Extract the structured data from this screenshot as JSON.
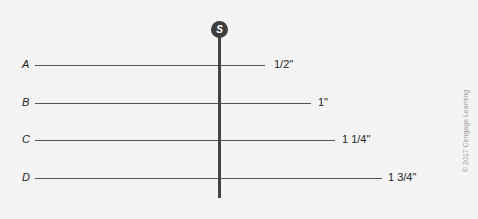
{
  "diagram": {
    "source_label": "S",
    "rows": [
      {
        "label": "A",
        "measurement": "1/2\"",
        "y": 65,
        "line_end": 265,
        "label_x": 274
      },
      {
        "label": "B",
        "measurement": "1\"",
        "y": 103,
        "line_end": 311,
        "label_x": 318
      },
      {
        "label": "C",
        "measurement": "1 1/4\"",
        "y": 140,
        "line_end": 335,
        "label_x": 342
      },
      {
        "label": "D",
        "measurement": "1 3/4\"",
        "y": 178,
        "line_end": 382,
        "label_x": 388
      }
    ],
    "copyright": "© 2017 Cengage Learning",
    "colors": {
      "background": "#f4f4f4",
      "line": "#555555",
      "badge": "#3d3d3d"
    }
  }
}
